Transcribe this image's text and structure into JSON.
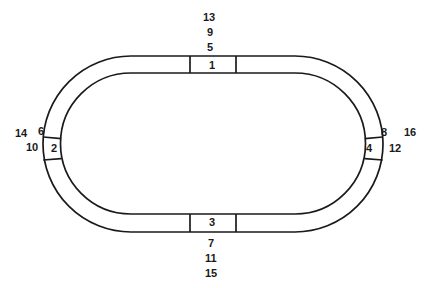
{
  "figure": {
    "kind": "oval-track-segment-diagram",
    "background_color": "#ffffff",
    "line_color": "#1a1a1a"
  },
  "track": {
    "shape": "stadium-oval-ring",
    "outer": {
      "x": 43,
      "y": 56,
      "width": 340,
      "height": 176,
      "corner_radius": 88
    },
    "inner": {
      "x": 61,
      "y": 73,
      "width": 304,
      "height": 141,
      "corner_radius": 70
    },
    "band_width_px": 18,
    "stroke_width_px": 1.6
  },
  "segments": [
    {
      "id": "1",
      "position": "top",
      "label": "1",
      "divider_start_px": 190,
      "divider_end_px": 236
    },
    {
      "id": "2",
      "position": "left",
      "label": "2",
      "divider_start_px": 137,
      "divider_end_px": 160
    },
    {
      "id": "3",
      "position": "bottom",
      "label": "3",
      "divider_start_px": 190,
      "divider_end_px": 236
    },
    {
      "id": "4",
      "position": "right",
      "label": "4",
      "divider_start_px": 137,
      "divider_end_px": 160
    }
  ],
  "outer_labels": {
    "top": {
      "values": [
        "13",
        "9",
        "5"
      ],
      "arrangement": "stacked-vertical"
    },
    "bottom": {
      "values": [
        "7",
        "11",
        "15"
      ],
      "arrangement": "stacked-vertical"
    },
    "left": {
      "values": [
        "14",
        "6",
        "10"
      ],
      "arrangement": "cluster"
    },
    "right": {
      "values": [
        "8",
        "16",
        "12"
      ],
      "arrangement": "cluster"
    }
  },
  "labels": {
    "n1": "1",
    "n2": "2",
    "n3": "3",
    "n4": "4",
    "n5": "5",
    "n6": "6",
    "n7": "7",
    "n8": "8",
    "n9": "9",
    "n10": "10",
    "n11": "11",
    "n12": "12",
    "n13": "13",
    "n14": "14",
    "n15": "15",
    "n16": "16"
  }
}
